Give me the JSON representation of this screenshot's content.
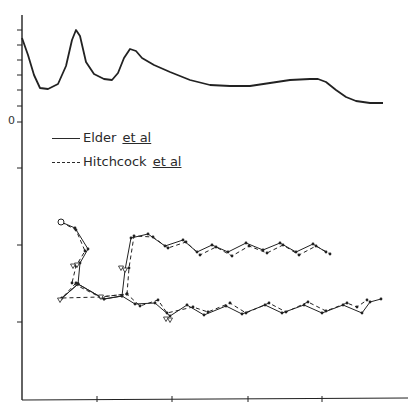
{
  "chart_data": {
    "type": "line",
    "title": "",
    "xlabel": "",
    "ylabel": "",
    "grid": false,
    "legend_position": "upper-left (below top curve)",
    "y_tick_labels": [
      "0"
    ],
    "x_tick_labels": [],
    "axis": {
      "x_px": [
        22,
        408
      ],
      "y_px": [
        15,
        400
      ],
      "x_ticks_px": [
        97,
        172,
        248,
        322
      ],
      "y_ticks_px": [
        30,
        45,
        60,
        75,
        90,
        106,
        122,
        168,
        245,
        322
      ],
      "zero_tick_px": 122
    },
    "legend": [
      {
        "label": "Elder",
        "label_suffix": "et al",
        "style": "solid"
      },
      {
        "label": "Hitchcock",
        "label_suffix": "et al",
        "style": "dashed"
      }
    ],
    "series": [
      {
        "name": "Top curve (Elder et al)",
        "style": "solid",
        "points_px": [
          [
            22,
            38
          ],
          [
            28,
            55
          ],
          [
            34,
            75
          ],
          [
            40,
            88
          ],
          [
            48,
            89
          ],
          [
            58,
            84
          ],
          [
            66,
            66
          ],
          [
            72,
            40
          ],
          [
            76,
            30
          ],
          [
            80,
            36
          ],
          [
            86,
            62
          ],
          [
            94,
            74
          ],
          [
            104,
            79
          ],
          [
            112,
            80
          ],
          [
            118,
            73
          ],
          [
            124,
            58
          ],
          [
            130,
            49
          ],
          [
            136,
            51
          ],
          [
            142,
            58
          ],
          [
            154,
            65
          ],
          [
            170,
            72
          ],
          [
            190,
            80
          ],
          [
            210,
            85
          ],
          [
            230,
            86
          ],
          [
            250,
            86
          ],
          [
            270,
            83
          ],
          [
            290,
            80
          ],
          [
            310,
            79
          ],
          [
            318,
            79
          ],
          [
            326,
            82
          ],
          [
            336,
            90
          ],
          [
            346,
            97
          ],
          [
            356,
            101
          ],
          [
            370,
            103
          ],
          [
            383,
            103
          ]
        ]
      },
      {
        "name": "Upper trace — Elder et al",
        "style": "solid",
        "points_px": [
          [
            61,
            222
          ],
          [
            75,
            228
          ],
          [
            88,
            249
          ],
          [
            80,
            263
          ],
          [
            78,
            284
          ],
          [
            104,
            299
          ],
          [
            122,
            296
          ],
          [
            125,
            270
          ],
          [
            131,
            238
          ],
          [
            148,
            234
          ],
          [
            165,
            246
          ],
          [
            183,
            240
          ],
          [
            197,
            252
          ],
          [
            212,
            245
          ],
          [
            228,
            252
          ],
          [
            246,
            243
          ],
          [
            263,
            250
          ],
          [
            280,
            243
          ],
          [
            296,
            252
          ],
          [
            313,
            244
          ],
          [
            326,
            252
          ]
        ]
      },
      {
        "name": "Upper trace — Hitchcock et al",
        "style": "dashed",
        "points_px": [
          [
            61,
            222
          ],
          [
            76,
            230
          ],
          [
            85,
            251
          ],
          [
            76,
            266
          ],
          [
            72,
            283
          ],
          [
            100,
            297
          ],
          [
            127,
            294
          ],
          [
            129,
            268
          ],
          [
            134,
            236
          ],
          [
            153,
            237
          ],
          [
            168,
            248
          ],
          [
            186,
            242
          ],
          [
            200,
            255
          ],
          [
            216,
            247
          ],
          [
            232,
            256
          ],
          [
            249,
            246
          ],
          [
            267,
            253
          ],
          [
            283,
            245
          ],
          [
            299,
            255
          ],
          [
            316,
            246
          ],
          [
            330,
            254
          ]
        ]
      },
      {
        "name": "Lower trace — Elder et al",
        "style": "solid",
        "points_px": [
          [
            78,
            284
          ],
          [
            61,
            299
          ],
          [
            78,
            284
          ],
          [
            104,
            299
          ],
          [
            122,
            296
          ],
          [
            135,
            304
          ],
          [
            155,
            303
          ],
          [
            170,
            316
          ],
          [
            187,
            305
          ],
          [
            204,
            315
          ],
          [
            226,
            306
          ],
          [
            242,
            314
          ],
          [
            265,
            305
          ],
          [
            282,
            313
          ],
          [
            304,
            305
          ],
          [
            322,
            313
          ],
          [
            343,
            305
          ],
          [
            362,
            313
          ],
          [
            370,
            302
          ],
          [
            381,
            299
          ]
        ]
      },
      {
        "name": "Lower trace — Hitchcock et al",
        "style": "dashed",
        "points_px": [
          [
            76,
            283
          ],
          [
            62,
            298
          ],
          [
            100,
            297
          ],
          [
            127,
            294
          ],
          [
            140,
            306
          ],
          [
            158,
            300
          ],
          [
            167,
            313
          ],
          [
            193,
            307
          ],
          [
            208,
            312
          ],
          [
            230,
            303
          ],
          [
            246,
            313
          ],
          [
            269,
            303
          ],
          [
            286,
            312
          ],
          [
            308,
            302
          ],
          [
            326,
            311
          ],
          [
            347,
            303
          ],
          [
            357,
            307
          ],
          [
            367,
            300
          ]
        ]
      }
    ]
  }
}
